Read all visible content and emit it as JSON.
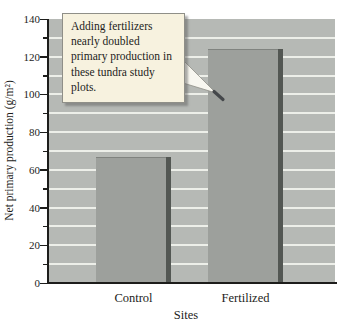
{
  "chart_data": {
    "type": "bar",
    "title": "",
    "categories": [
      "Control",
      "Fertilized"
    ],
    "values": [
      67,
      124
    ],
    "xlabel": "Sites",
    "ylabel": "Net primary production (g/m²)",
    "ylim": [
      0,
      140
    ],
    "ytick_major_step": 20,
    "ytick_minor_step": 10,
    "grid": "horizontal white lines every 10 units",
    "legend": "none",
    "annotation": {
      "text": "Adding fertilizers nearly doubled primary production in these tundra study plots.",
      "points_to": "Fertilized bar near the 100 g/m² level"
    }
  },
  "colors": {
    "figure_bg": "#ffffff",
    "plot_bg": "#b6b9b5",
    "grid_line": "#edefe9",
    "bar_fill": "#9da09c",
    "bar_side_shadow": "#535753",
    "axis": "#1d1d1b",
    "callout_bg": "#f7f2df",
    "callout_border": "#8f8f88",
    "text": "#1d1d1b"
  }
}
